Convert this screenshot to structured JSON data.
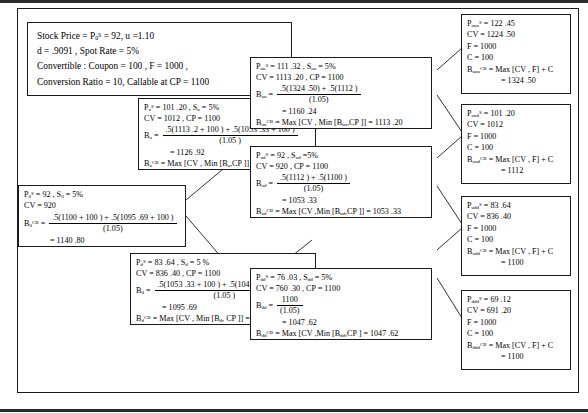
{
  "figure": {
    "type": "binomial-tree-diagram",
    "assumptions": {
      "name": "assumptions-box",
      "lines": [
        "Stock Price = P₀ˢ = 92, u = 1.10",
        "d = .9091 , Spot Rate = 5%,",
        "Convertible : Coupon = 100 , F = 1000 ,",
        "Conversion Ratio = 10, Callable at CP = 1100"
      ],
      "values": {
        "stock_price": "92",
        "u": "1.10",
        "d": ".9091",
        "spot_rate": "5%",
        "coupon": "100",
        "face_value": "1000",
        "conversion_ratio": "10",
        "call_price": "1100"
      }
    }
  },
  "nodes": {
    "root": {
      "name": "node-0",
      "price_label": "P",
      "price_sub": "0",
      "price_sup": "S",
      "price_value": "92",
      "spot_label": "S",
      "spot_sub": "0",
      "spot_value": "5%",
      "cv_label": "CV",
      "cv_value": "920",
      "b_label": "B",
      "b_sub": "0",
      "b_sup": "CB",
      "num": ".5(1100 + 100 ) + .5(1095 .69 + 100 )",
      "den": "(1.05)",
      "result": "= 1140 .80"
    },
    "u": {
      "name": "node-u",
      "price_value": "101 .20",
      "price_sub": "u",
      "spot_sub": "u",
      "spot_value": "5%",
      "cv_value": "1012",
      "cp_text": "CP  = 1100",
      "b_sub": "u",
      "num": ".5(1113 .2 + 100 ) + .5(1053 .33 + 100 )",
      "den": "(1.05 )",
      "result": "= 1126 .92",
      "max_line": "= Max [CV , Min [B",
      "max_tail": ",CP ]] = 1100"
    },
    "d": {
      "name": "node-d",
      "price_value": "83 .64",
      "price_sub": "d",
      "spot_sub": "d",
      "spot_value": "5 %",
      "cv_value": "836 .40",
      "cp_text": "CP  = 1100",
      "b_sub": "d",
      "num": ".5(1053 .33 + 100 ) + .5(1047 .62 + 100 )",
      "den": "(1.05 )",
      "result": "= 1095 .69",
      "max_line": "= Max [CV ,  Min [B",
      "max_tail": ", CP ]] = 1095 .69"
    },
    "uu": {
      "name": "node-uu",
      "price_value": "111 .32",
      "price_sub": "uu",
      "spot_sub": "uu",
      "spot_value": "5%",
      "cv_value": "1113 .20",
      "cp_text": "CP  = 1100",
      "b_sub": "uu",
      "num": ".5(1324 .50) + .5(1112 )",
      "den": "(1.05)",
      "result": "= 1160 .24",
      "max_line": "= Max [CV , Min [B",
      "max_tail": ",CP ]] = 1113 .20"
    },
    "ud": {
      "name": "node-ud",
      "price_value": "92",
      "price_sub": "ud",
      "spot_sub": "ud",
      "spot_value": "5%",
      "cv_value": "920",
      "cp_text": "CP  = 1100",
      "b_sub": "ud",
      "num": ".5(1112 ) + .5(1100 )",
      "den": "(1.05)",
      "result": "= 1053 .33",
      "max_line": "= Max [CV ,Min [B",
      "max_tail": ",CP ]] = 1053 .33"
    },
    "dd": {
      "name": "node-dd",
      "price_value": "76 .03",
      "price_sub": "dd",
      "spot_sub": "dd",
      "spot_value": "5%",
      "cv_value": "760 .30",
      "cp_text": "CP  = 1100",
      "b_sub": "dd",
      "num": "1100",
      "den": "(1.05)",
      "result": "= 1047 .62",
      "max_line": "= Max [CV ,Min [B",
      "max_tail": ",CP ] = 1047 .62"
    },
    "uuu": {
      "name": "node-uuu",
      "price_value": "122 .45",
      "price_sub": "uuu",
      "cv_value": "1224 .50",
      "f_line": "F = 1000",
      "c_line": "C = 100",
      "b_sub": "uuu",
      "b_expr": "= Max [CV , F] + C",
      "result": "= 1324 .50"
    },
    "uud": {
      "name": "node-uud",
      "price_value": "101 .20",
      "price_sub": "uud",
      "cv_value": "1012",
      "f_line": "F = 1000",
      "c_line": "C = 100",
      "b_sub": "uud",
      "b_expr": "= Max [CV , F] + C",
      "result": "= 1112"
    },
    "udd": {
      "name": "node-udd",
      "price_value": "83 .64",
      "price_sub": "udd",
      "cv_value": "836 .40",
      "f_line": "F = 1000",
      "c_line": "C = 100",
      "b_sub": "udd",
      "b_expr": "= Max [CV , F] + C",
      "result": "= 1100"
    },
    "ddd": {
      "name": "node-ddd",
      "price_value": "69 .12",
      "price_sub": "ddd",
      "cv_value": "691 .20",
      "f_line": "F = 1000",
      "c_line": "C = 100",
      "b_sub": "ddd",
      "b_expr": "= Max [CV , F] + C",
      "result": "= 1100"
    }
  },
  "symbols": {
    "P": "P",
    "S": "S",
    "CV": "CV",
    "B": "B",
    "CB": "CB",
    "eq": "=",
    "comma": ",",
    "CP": "CP"
  },
  "colors": {
    "border": "#1a1a1a",
    "background": "#ffffff",
    "text": "#000000"
  }
}
